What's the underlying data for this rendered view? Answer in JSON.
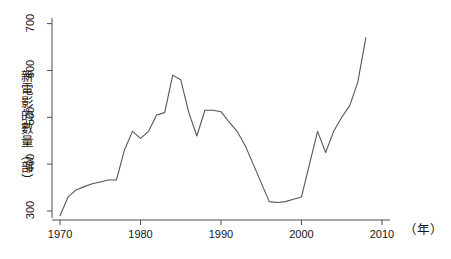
{
  "chart_data": {
    "type": "line",
    "title": "",
    "xlabel": "（年）",
    "ylabel": "新電影的數量（部）",
    "xlim": [
      1969,
      2011
    ],
    "ylim": [
      285,
      712
    ],
    "grid": false,
    "legend": null,
    "xticks": [
      1970,
      1980,
      1990,
      2000,
      2010
    ],
    "yticks": [
      300,
      400,
      500,
      600,
      700
    ],
    "line_color": "#555555",
    "series": [
      {
        "name": "新電影的數量",
        "x": [
          1970,
          1971,
          1972,
          1973,
          1974,
          1975,
          1976,
          1977,
          1978,
          1979,
          1980,
          1981,
          1982,
          1983,
          1984,
          1985,
          1986,
          1987,
          1988,
          1989,
          1990,
          1991,
          1992,
          1993,
          1994,
          1995,
          1996,
          1997,
          1998,
          1999,
          2000,
          2001,
          2002,
          2003,
          2004,
          2005,
          2006,
          2007,
          2008
        ],
        "values": [
          290,
          330,
          345,
          352,
          358,
          362,
          366,
          366,
          430,
          470,
          455,
          470,
          505,
          510,
          590,
          580,
          510,
          460,
          515,
          515,
          512,
          490,
          470,
          440,
          400,
          360,
          320,
          318,
          320,
          325,
          330,
          400,
          470,
          425,
          470,
          500,
          525,
          575,
          670
        ]
      }
    ]
  },
  "axis": {
    "y_title": "新電影的數量（部）",
    "x_title": "（年）",
    "y_tick_labels": [
      "300",
      "400",
      "500",
      "600",
      "700"
    ],
    "x_tick_labels": [
      "1970",
      "1980",
      "1990",
      "2000",
      "2010"
    ]
  }
}
